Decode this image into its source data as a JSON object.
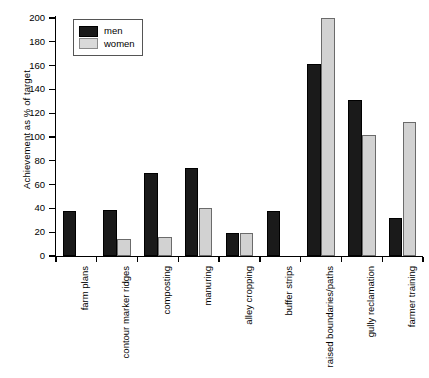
{
  "chart_data": {
    "type": "bar",
    "title": "",
    "xlabel": "",
    "ylabel": "Achievement as % of target",
    "ylim": [
      0,
      200
    ],
    "ytick_step": 20,
    "yticks": [
      0,
      20,
      40,
      60,
      80,
      100,
      120,
      140,
      160,
      180,
      200
    ],
    "grid": false,
    "legend_position": "top-left",
    "categories": [
      "farm plans",
      "contour marker ridges",
      "composting",
      "manuring",
      "alley cropping",
      "buffer strips",
      "raised boundaries/paths",
      "gully reclamation",
      "farmer training"
    ],
    "series": [
      {
        "name": "men",
        "color": "#1a1a1a",
        "values": [
          38,
          39,
          70,
          74,
          19,
          38,
          161,
          131,
          32
        ]
      },
      {
        "name": "women",
        "color": "#d2d2d2",
        "values": [
          0,
          14,
          16,
          40,
          19,
          0,
          200,
          102,
          113
        ]
      }
    ]
  },
  "legend": {
    "items": [
      {
        "label": "men"
      },
      {
        "label": "women"
      }
    ]
  },
  "caption": {
    "text": ""
  }
}
